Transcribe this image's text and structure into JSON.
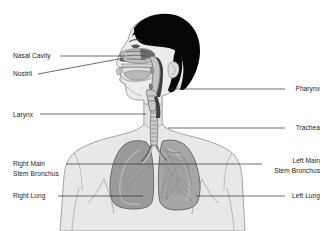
{
  "diagram": {
    "background_color": "#ffffff",
    "width": 333,
    "height": 231,
    "colors": {
      "hair": "#060606",
      "skin_body": "#e8e8e8",
      "body_outline": "#8a8a8a",
      "lung_right": "#9a9a9a",
      "lung_left": "#a6a6a6",
      "lung_outline": "#6f6f6f",
      "trachea": "#c9c9c9",
      "leader_line": "#2b2b2b",
      "text": "#1a1a1a"
    },
    "labels_left": [
      {
        "id": "nasal-cavity",
        "text": "Nasal Cavity",
        "text_x": 13,
        "text_y": 58,
        "line": [
          [
            60,
            56
          ],
          [
            125,
            56
          ]
        ]
      },
      {
        "id": "nostril",
        "text": "Nostril",
        "text_x": 13,
        "text_y": 76,
        "line": [
          [
            38,
            74
          ],
          [
            124,
            58
          ]
        ]
      },
      {
        "id": "larynx",
        "text": "Larynx",
        "text_x": 13,
        "text_y": 117,
        "line": [
          [
            40,
            114
          ],
          [
            146,
            114
          ]
        ]
      },
      {
        "id": "right-main-stem-bronchus",
        "text": "Right Main",
        "text2": "Stem Bronchus",
        "text_x": 13,
        "text_y": 166,
        "text2_y": 176,
        "line": [
          [
            66,
            164
          ],
          [
            162,
            164
          ]
        ]
      },
      {
        "id": "right-lung",
        "text": "Right Lung",
        "text_x": 13,
        "text_y": 198,
        "line": [
          [
            58,
            196
          ],
          [
            143,
            196
          ]
        ]
      }
    ],
    "labels_right": [
      {
        "id": "pharynx",
        "text": "Pharynx",
        "text_x": 320,
        "text_y": 91,
        "line": [
          [
            170,
            89
          ],
          [
            285,
            89
          ]
        ]
      },
      {
        "id": "trachea",
        "text": "Trachea",
        "text_x": 320,
        "text_y": 130,
        "line": [
          [
            168,
            128
          ],
          [
            285,
            128
          ]
        ]
      },
      {
        "id": "left-main-stem-bronchus",
        "text": "Left Main",
        "text2": "Stem Bronchus",
        "text_x": 320,
        "text_y": 163,
        "text2_y": 173,
        "line": [
          [
            162,
            164
          ],
          [
            262,
            164
          ]
        ]
      },
      {
        "id": "left-lung",
        "text": "Left Lung",
        "text_x": 320,
        "text_y": 198,
        "line": [
          [
            196,
            196
          ],
          [
            285,
            196
          ]
        ]
      }
    ]
  }
}
